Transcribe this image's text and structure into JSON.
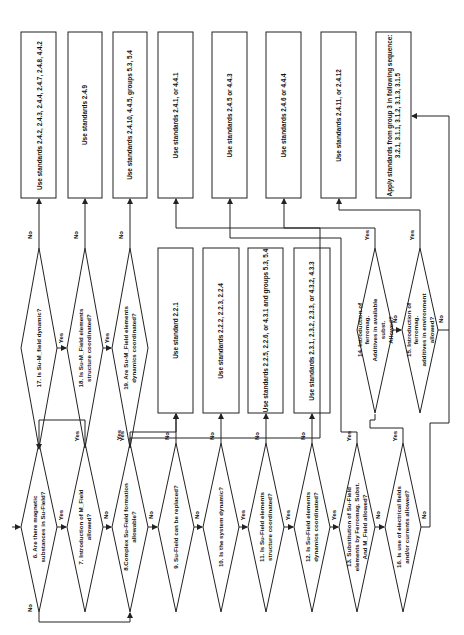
{
  "diagram": {
    "type": "flowchart",
    "orientation": "rotated-90-ccw",
    "colors": {
      "stroke": "#222222",
      "background": "#ffffff",
      "text": "#111111"
    },
    "decisions": [
      {
        "id": "d6",
        "text": "6. Are there magnetic\nsubstances in Su-Field?"
      },
      {
        "id": "d7",
        "text": "7. Introduction of M_Field\nallowed?"
      },
      {
        "id": "d8",
        "text": "8.Complex Su-Field formation\nallowable?"
      },
      {
        "id": "d9",
        "text": "9. Su-Field can be replaced?"
      },
      {
        "id": "d10",
        "text": "10. Is the system dynamic?"
      },
      {
        "id": "d11",
        "text": "11. Is Su-Field elements\nstructure coordinated?"
      },
      {
        "id": "d12",
        "text": "12. Is Su-Field elements\ndynamics coordinated?"
      },
      {
        "id": "d13",
        "text": "13. Substitution of Su-Field\nelements by Ferromag. Subst.\nAnd M_Field allowed?"
      },
      {
        "id": "d14",
        "text": "14. Introduction of ferromag.\nAdditives in available subst.\nAllowed?"
      },
      {
        "id": "d15",
        "text": "15. Introduction of ferromag.\nadditives in environment\nallowed?"
      },
      {
        "id": "d16",
        "text": "16. Is use of electrical fields\nand/or currents allowed?"
      },
      {
        "id": "d17",
        "text": "17. Is Su-M_field dynamic?"
      },
      {
        "id": "d18",
        "text": "18. Is Su-M_Field elements\nstructure coordinated?"
      },
      {
        "id": "d19",
        "text": "19. Are Su-M_Field elements\ndynamics coordinated?"
      }
    ],
    "top_boxes": [
      {
        "id": "t1",
        "text": "Use standards 2.4.2, 2.4.3, 2.4.4, 2.4.7, 2.4.8, 4.4.2"
      },
      {
        "id": "t2",
        "text": "Use standards 2.4.9"
      },
      {
        "id": "t3",
        "text": "Use standards 2.4.10, 4.4.5, groups 5.3, 5.4"
      },
      {
        "id": "t4",
        "text": "Use standards 2.4.1, or 4.4.1"
      },
      {
        "id": "t5",
        "text": "Use standards 2.4.5 or 4.4.3"
      },
      {
        "id": "t6",
        "text": "Use standards 2.4.6 or 4.4.4"
      },
      {
        "id": "t7",
        "text": "Use standards 2.4.11, or 2.4.12"
      },
      {
        "id": "t8",
        "text": "Apply standards from group 3 in following sequence:\n3.2.1, 3.1.1, 3.1.2, 3.1.3, 3.1.5"
      }
    ],
    "mid_boxes": [
      {
        "id": "m1",
        "text": "Use standard 2.2.1"
      },
      {
        "id": "m2",
        "text": "Use standards 2.2.2, 2.2.3, 2.2.4"
      },
      {
        "id": "m3",
        "text": "Use standards 2.2.5, 2.2.6, or 4.3.1 and groups 5.3, 5.4"
      },
      {
        "id": "m4",
        "text": "Use standards 2.3.1, 2.3.2, 2.3.3, or 4.3.2, 4.3.3"
      }
    ],
    "labels": {
      "yes": "Yes",
      "no": "No"
    }
  }
}
